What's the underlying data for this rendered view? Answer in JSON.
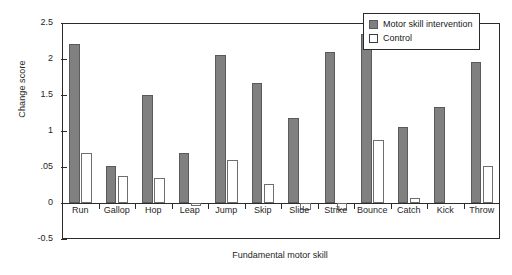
{
  "chart_data": {
    "type": "bar",
    "title": "",
    "xlabel": "Fundamental motor skill",
    "ylabel": "Change score",
    "ylim": [
      -0.5,
      2.5
    ],
    "ytick_labels": [
      "2.5",
      "2",
      "1.5",
      "1",
      ".05",
      "0",
      "-0.5"
    ],
    "ytick_values": [
      2.5,
      2.0,
      1.5,
      1.0,
      0.5,
      0.0,
      -0.5
    ],
    "grid": false,
    "legend_position": "top-right",
    "categories": [
      "Run",
      "Gallop",
      "Hop",
      "Leap",
      "Jump",
      "Skip",
      "Slide",
      "Strike",
      "Bounce",
      "Catch",
      "Kick",
      "Throw"
    ],
    "series": [
      {
        "name": "Motor skill intervention",
        "color": "#808080",
        "values": [
          2.21,
          0.52,
          1.5,
          0.69,
          2.06,
          1.66,
          1.18,
          2.1,
          2.35,
          1.05,
          1.33,
          1.96
        ]
      },
      {
        "name": "Control",
        "color": "#ffffff",
        "values": [
          0.7,
          0.37,
          0.35,
          -0.04,
          0.6,
          0.27,
          -0.1,
          -0.1,
          0.87,
          0.07,
          0.0,
          0.52
        ]
      }
    ]
  },
  "legend": {
    "items": [
      {
        "label": "Motor skill intervention",
        "style": "intervention"
      },
      {
        "label": "Control",
        "style": "control"
      }
    ]
  }
}
